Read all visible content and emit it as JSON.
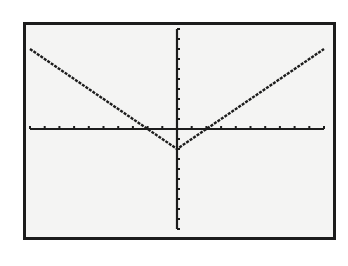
{
  "chart_data": {
    "type": "line",
    "title": "",
    "xlabel": "",
    "ylabel": "",
    "function": "y = |x| - 2",
    "window": {
      "xmin": -10,
      "xmax": 10,
      "xscl": 1,
      "ymin": -10,
      "ymax": 10,
      "yscl": 1
    },
    "grid": false,
    "legend": null,
    "series": [
      {
        "name": "Y1",
        "x": [
          -10,
          -2,
          0,
          2,
          10
        ],
        "y": [
          8,
          0,
          -2,
          0,
          8
        ]
      }
    ],
    "vertex": [
      0,
      -2
    ],
    "x_intercepts": [
      -2,
      2
    ]
  },
  "colors": {
    "screen_bg": "#f4f4f3",
    "ink": "#1c1c1c",
    "page_bg": "#ffffff"
  },
  "labels": {
    "screen": "Graphing calculator screen"
  }
}
